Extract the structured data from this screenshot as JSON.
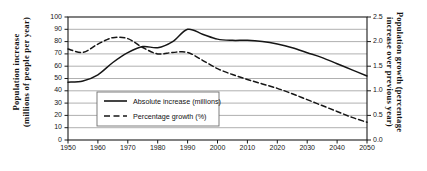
{
  "figure": {
    "background": "#ffffff",
    "ink_color": "#161616",
    "gridline_color": "#8e8e8e",
    "frame_color": "#1a1a1a"
  },
  "axes": {
    "left": {
      "title_line1": "Population increase",
      "title_line2": "(millions of people per year)",
      "ticks": [
        "0",
        "10",
        "20",
        "30",
        "40",
        "50",
        "60",
        "70",
        "80",
        "90",
        "100"
      ],
      "min": 0,
      "max": 100
    },
    "right": {
      "title_line1": "Population growth (percentage",
      "title_line2": "increase over previous year)",
      "ticks": [
        "0.0",
        "0.5",
        "1.0",
        "1.5",
        "2.0",
        "2.5"
      ],
      "min": 0,
      "max": 2.5
    },
    "bottom": {
      "ticks": [
        "1950",
        "1960",
        "1970",
        "1980",
        "1990",
        "2000",
        "2010",
        "2020",
        "2030",
        "2040",
        "2050"
      ],
      "min": 1950,
      "max": 2050
    }
  },
  "legend": {
    "position": "inside-bottom-left",
    "entries": [
      {
        "label": "Absolute increase (millions)",
        "style": "solid",
        "series": "absolute_increase"
      },
      {
        "label": "Percentage growth (%)",
        "style": "dashed",
        "series": "percentage_growth"
      }
    ]
  },
  "page_artifact": "",
  "chart_data": {
    "type": "line",
    "title": "",
    "xlabel": "",
    "ylabel": "Population increase (millions of people per year)",
    "y2label": "Population growth (percentage increase over previous year)",
    "xlim": [
      1950,
      2050
    ],
    "ylim": [
      0,
      100
    ],
    "y2lim": [
      0,
      2.5
    ],
    "grid": true,
    "grid_axis": "y",
    "legend_position": "inside-bottom-left",
    "x": [
      1950,
      1955,
      1960,
      1965,
      1970,
      1975,
      1980,
      1985,
      1990,
      1995,
      2000,
      2005,
      2010,
      2015,
      2020,
      2025,
      2030,
      2035,
      2040,
      2045,
      2050
    ],
    "series": [
      {
        "name": "Absolute increase (millions)",
        "axis": "left",
        "style": "solid",
        "units": "millions of people per year",
        "values": [
          47,
          48,
          53,
          63,
          71,
          76,
          75,
          80,
          90,
          86,
          82,
          81,
          81,
          80,
          78,
          75,
          71,
          67,
          62,
          57,
          52
        ]
      },
      {
        "name": "Percentage growth (%)",
        "axis": "right",
        "style": "dashed",
        "units": "percent increase over previous year",
        "values": [
          1.85,
          1.78,
          1.95,
          2.08,
          2.06,
          1.88,
          1.75,
          1.78,
          1.78,
          1.62,
          1.45,
          1.33,
          1.23,
          1.14,
          1.05,
          0.94,
          0.82,
          0.7,
          0.58,
          0.46,
          0.36
        ]
      }
    ],
    "annotations": []
  }
}
